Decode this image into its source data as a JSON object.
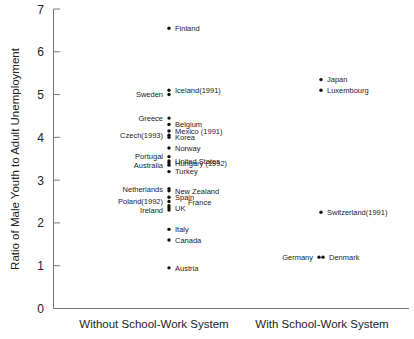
{
  "chart_data": {
    "type": "scatter",
    "title": "",
    "xlabel": "",
    "ylabel": "Ratio of Male Youth to Adult Unemployment",
    "ylim": [
      0,
      7
    ],
    "yticks": [
      0,
      1,
      2,
      3,
      4,
      5,
      6,
      7
    ],
    "grid": false,
    "legend": null,
    "categories": [
      "Without School-Work System",
      "With School-Work System"
    ],
    "series": [
      {
        "name": "Without School-Work System",
        "points": [
          {
            "label": "Finland",
            "value": 6.55,
            "side": "right"
          },
          {
            "label": "Iceland(1991)",
            "value": 5.1,
            "side": "right"
          },
          {
            "label": "Sweden",
            "value": 5.0,
            "side": "left"
          },
          {
            "label": "Greece",
            "value": 4.45,
            "side": "left"
          },
          {
            "label": "Belgium",
            "value": 4.3,
            "side": "right"
          },
          {
            "label": "Mexico (1991)",
            "value": 4.15,
            "side": "right"
          },
          {
            "label": "Czech(1993)",
            "value": 4.05,
            "side": "left"
          },
          {
            "label": "Korea",
            "value": 4.0,
            "side": "right"
          },
          {
            "label": "Norway",
            "value": 3.75,
            "side": "right"
          },
          {
            "label": "Portugal",
            "value": 3.55,
            "side": "left"
          },
          {
            "label": "United States",
            "value": 3.45,
            "side": "right"
          },
          {
            "label": "Hungary (1992)",
            "value": 3.4,
            "side": "right"
          },
          {
            "label": "Australia",
            "value": 3.35,
            "side": "left"
          },
          {
            "label": "Turkey",
            "value": 3.2,
            "side": "right"
          },
          {
            "label": "Netherlands",
            "value": 2.8,
            "side": "left"
          },
          {
            "label": "New Zealand",
            "value": 2.75,
            "side": "right"
          },
          {
            "label": "Spain",
            "value": 2.6,
            "side": "right"
          },
          {
            "label": "Poland(1992)",
            "value": 2.5,
            "side": "left"
          },
          {
            "label": "France",
            "value": 2.4,
            "side": "right-offset"
          },
          {
            "label": "UK",
            "value": 2.35,
            "side": "right"
          },
          {
            "label": "Ireland",
            "value": 2.3,
            "side": "left"
          },
          {
            "label": "Italy",
            "value": 1.85,
            "side": "right"
          },
          {
            "label": "Canada",
            "value": 1.6,
            "side": "right"
          },
          {
            "label": "Austria",
            "value": 0.95,
            "side": "right"
          }
        ]
      },
      {
        "name": "With School-Work System",
        "points": [
          {
            "label": "Japan",
            "value": 5.35,
            "side": "right"
          },
          {
            "label": "Luxembourg",
            "value": 5.1,
            "side": "right"
          },
          {
            "label": "Switzerland(1991)",
            "value": 2.25,
            "side": "right"
          },
          {
            "label": "Germany",
            "value": 1.2,
            "side": "left"
          },
          {
            "label": "Denmark",
            "value": 1.2,
            "side": "right"
          }
        ]
      }
    ]
  },
  "axis": {
    "ylabel": "Ratio of Male Youth to Adult Unemployment",
    "xcat_left": "Without School-Work System",
    "xcat_right": "With School-Work System",
    "ticks": [
      "0",
      "1",
      "2",
      "3",
      "4",
      "5",
      "6",
      "7"
    ]
  }
}
